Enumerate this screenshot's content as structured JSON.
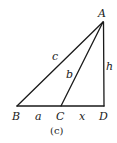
{
  "diagram": {
    "points": {
      "A": {
        "label": "A",
        "x": 103,
        "y": 22
      },
      "B": {
        "label": "B",
        "x": 17,
        "y": 106
      },
      "C": {
        "label": "C",
        "x": 61,
        "y": 106
      },
      "D": {
        "label": "D",
        "x": 104,
        "y": 106
      }
    },
    "segments": {
      "c": "c",
      "b": "b",
      "h": "h",
      "a": "a",
      "x": "x"
    },
    "caption": "(c)",
    "stroke_color": "#1a1a1a"
  }
}
